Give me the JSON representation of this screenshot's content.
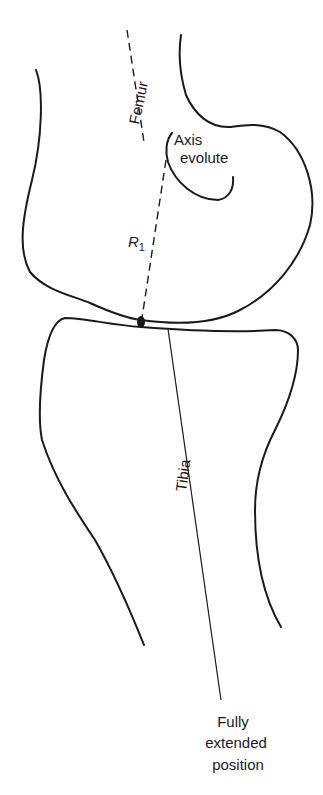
{
  "figure": {
    "labels": {
      "femur": "Femur",
      "axis_line1": "Axis",
      "axis_line2": "evolute",
      "r_main": "R",
      "r_sub": "1",
      "tibia": "Tibia",
      "position_line1": "Fully",
      "position_line2": "extended",
      "position_line3": "position"
    },
    "colors": {
      "stroke": "#1a1a1a",
      "background": "#ffffff"
    }
  }
}
